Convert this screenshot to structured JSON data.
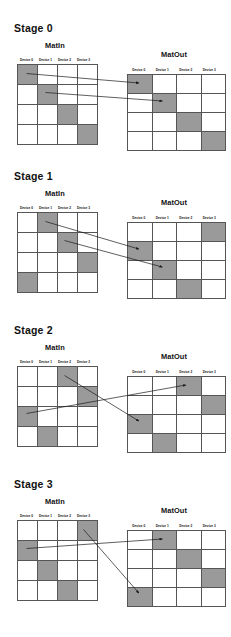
{
  "figure": {
    "type": "all-to-all-permutation-diagram",
    "column_headers": [
      "Device 0",
      "Device 1",
      "Device 2",
      "Device 3"
    ],
    "matrix_labels": {
      "input": "MatIn",
      "output": "MatOut"
    },
    "colors": {
      "shaded_cell": "#9a9a9a",
      "empty_cell": "#ffffff",
      "grid_line": "#555555",
      "arrow": "#1a1a1a",
      "text": "#111111"
    },
    "grid_size": {
      "rows": 4,
      "cols": 4
    }
  },
  "stages": [
    {
      "title": "Stage 0",
      "matin_label": "MatIn",
      "matout_label": "MatOut",
      "matin_shaded_cols": [
        0,
        1,
        2,
        3
      ],
      "matout_shaded_cols": [
        0,
        1,
        2,
        3
      ],
      "arrows": [
        {
          "from_row": 0,
          "from_col": 0,
          "to_row": 0,
          "to_col": 0
        },
        {
          "from_row": 1,
          "from_col": 1,
          "to_row": 1,
          "to_col": 1
        }
      ]
    },
    {
      "title": "Stage 1",
      "matin_label": "MatIn",
      "matout_label": "MatOut",
      "matin_shaded_cols": [
        1,
        2,
        3,
        0
      ],
      "matout_shaded_cols": [
        3,
        0,
        1,
        2
      ],
      "arrows": [
        {
          "from_row": 0,
          "from_col": 1,
          "to_row": 1,
          "to_col": 0
        },
        {
          "from_row": 1,
          "from_col": 2,
          "to_row": 2,
          "to_col": 1
        }
      ]
    },
    {
      "title": "Stage 2",
      "matin_label": "MatIn",
      "matout_label": "MatOut",
      "matin_shaded_cols": [
        2,
        3,
        0,
        1
      ],
      "matout_shaded_cols": [
        2,
        3,
        0,
        1
      ],
      "arrows": [
        {
          "from_row": 0,
          "from_col": 2,
          "to_row": 2,
          "to_col": 0
        },
        {
          "from_row": 2,
          "from_col": 0,
          "to_row": 0,
          "to_col": 2
        }
      ]
    },
    {
      "title": "Stage 3",
      "matin_label": "MatIn",
      "matout_label": "MatOut",
      "matin_shaded_cols": [
        3,
        0,
        1,
        2
      ],
      "matout_shaded_cols": [
        1,
        2,
        3,
        0
      ],
      "arrows": [
        {
          "from_row": 0,
          "from_col": 3,
          "to_row": 3,
          "to_col": 0
        },
        {
          "from_row": 1,
          "from_col": 0,
          "to_row": 0,
          "to_col": 1
        }
      ]
    }
  ]
}
